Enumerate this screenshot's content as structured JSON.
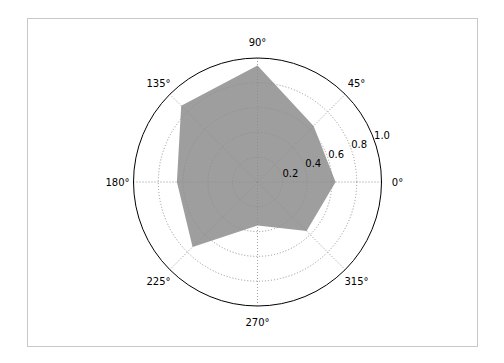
{
  "chart_data": {
    "type": "polar-area",
    "title": "",
    "theta_ticks": [
      "0°",
      "45°",
      "90°",
      "135°",
      "180°",
      "225°",
      "270°",
      "315°"
    ],
    "theta_degrees": [
      0,
      45,
      90,
      135,
      180,
      225,
      270,
      315
    ],
    "r_ticks": [
      "0.2",
      "0.4",
      "0.6",
      "0.8",
      "1.0"
    ],
    "r_tick_values": [
      0.2,
      0.4,
      0.6,
      0.8,
      1.0
    ],
    "rlim": [
      0,
      1.0
    ],
    "grid": true,
    "series": [
      {
        "name": "",
        "theta": [
          0,
          45,
          90,
          135,
          180,
          225,
          270,
          315
        ],
        "values": [
          0.63,
          0.64,
          0.94,
          0.87,
          0.65,
          0.74,
          0.35,
          0.56
        ],
        "fill": "#9e9e9e"
      }
    ]
  },
  "colors": {
    "fill": "#9e9e9e",
    "grid": "#b0b0b0",
    "spine": "#000000",
    "frame": "#bfbfbf"
  }
}
